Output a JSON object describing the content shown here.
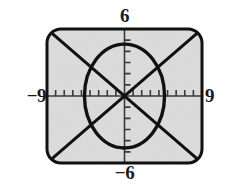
{
  "figure": {
    "kind": "graphing-calculator-screen",
    "screen": {
      "background_color": "#dcdcdc",
      "border_color": "#111111",
      "corner_radius": 14,
      "left": 47,
      "top": 29,
      "width": 155,
      "height": 134
    },
    "labels": {
      "top": "6",
      "bottom": "−6",
      "left": "−9",
      "right": "9"
    }
  },
  "chart_data": {
    "type": "line",
    "title": "",
    "subtitle": "",
    "xlabel": "",
    "ylabel": "",
    "xlim": [
      -9,
      9
    ],
    "ylim": [
      -6,
      6
    ],
    "grid": false,
    "legend": "none",
    "axes": {
      "x_axis_at_y": 0,
      "y_axis_at_x": 0,
      "x_tick_step": 1,
      "y_tick_step": 1,
      "x_ticks": [
        -8,
        -7,
        -6,
        -5,
        -4,
        -3,
        -2,
        -1,
        1,
        2,
        3,
        4,
        5,
        6,
        7,
        8
      ],
      "y_ticks": [
        -5,
        -4,
        -3,
        -2,
        -1,
        1,
        2,
        3,
        4,
        5
      ],
      "tick_mark_length_px": 6,
      "tick_label_visible": false,
      "axis_color": "#3a3a3a"
    },
    "curve_color": "#111111",
    "curve_width_px": 3,
    "series": [
      {
        "name": "circle",
        "type": "implicit-circle",
        "equation": "x^2 + y^2 = 21.5",
        "center": [
          0,
          0
        ],
        "radius": 4.65,
        "x_intercepts": [
          -4.65,
          4.65
        ],
        "y_intercepts": [
          -4.65,
          4.65
        ]
      },
      {
        "name": "line-rising",
        "type": "line",
        "equation": "y = (2/3)x",
        "slope": 0.6667,
        "intercept": 0,
        "x": [
          -9,
          9
        ],
        "values": [
          -6,
          6
        ]
      },
      {
        "name": "line-falling",
        "type": "line",
        "equation": "y = -(2/3)x",
        "slope": -0.6667,
        "intercept": 0,
        "x": [
          -9,
          9
        ],
        "values": [
          6,
          -6
        ]
      }
    ],
    "annotations": [
      {
        "text": "6",
        "position": "top-of-y-axis"
      },
      {
        "text": "−6",
        "position": "bottom-of-y-axis"
      },
      {
        "text": "−9",
        "position": "left-of-x-axis"
      },
      {
        "text": "9",
        "position": "right-of-x-axis"
      }
    ]
  }
}
